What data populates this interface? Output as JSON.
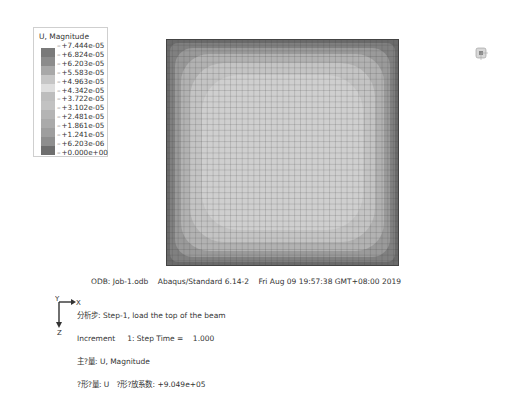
{
  "legend": {
    "title": "U, Magnitude",
    "values": [
      "+7.444e-05",
      "+6.824e-05",
      "+6.203e-05",
      "+5.583e-05",
      "+4.963e-05",
      "+4.342e-05",
      "+3.722e-05",
      "+3.102e-05",
      "+2.481e-05",
      "+1.861e-05",
      "+1.241e-05",
      "+6.203e-06",
      "+0.000e+00"
    ],
    "colors": [
      "#7a7a7a",
      "#8c8c8c",
      "#a8a8a8",
      "#c6c6c6",
      "#dedede",
      "#bdbdbd",
      "#c2c2c2",
      "#b4b4b4",
      "#aaaaaa",
      "#9e9e9e",
      "#8e8e8e",
      "#6e6e6e",
      "#5e5e5e"
    ]
  },
  "footer": {
    "odb_line": "ODB: Job-1.odb    Abaqus/Standard 6.14-2    Fri Aug 09 19:57:38 GMT+08:00 2019",
    "step_line": "分析步: Step-1, load the top of the beam",
    "increment_line": "Increment     1: Step Time =    1.000",
    "primary_var_line": "主?量: U, Magnitude",
    "deformed_line": "?形?量: U   ?形?放系数: +9.049e+05"
  },
  "triad": {
    "x_label": "X",
    "y_label": "Y",
    "z_label": "Z"
  },
  "viewport": {
    "mesh_divisions": 40
  }
}
